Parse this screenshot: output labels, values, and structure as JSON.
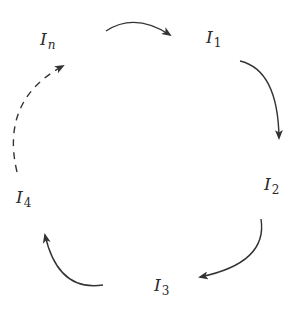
{
  "diagram": {
    "type": "cycle",
    "nodes": [
      {
        "id": "In",
        "base": "I",
        "subscript": "n",
        "subscript_italic": true
      },
      {
        "id": "I1",
        "base": "I",
        "subscript": "1",
        "subscript_italic": false
      },
      {
        "id": "I2",
        "base": "I",
        "subscript": "2",
        "subscript_italic": false
      },
      {
        "id": "I3",
        "base": "I",
        "subscript": "3",
        "subscript_italic": false
      },
      {
        "id": "I4",
        "base": "I",
        "subscript": "4",
        "subscript_italic": false
      }
    ],
    "edges": [
      {
        "from": "In",
        "to": "I1",
        "style": "solid"
      },
      {
        "from": "I1",
        "to": "I2",
        "style": "solid"
      },
      {
        "from": "I2",
        "to": "I3",
        "style": "solid"
      },
      {
        "from": "I3",
        "to": "I4",
        "style": "solid"
      },
      {
        "from": "I4",
        "to": "In",
        "style": "dashed"
      }
    ],
    "colors": {
      "stroke": "#333333",
      "text": "#2a2a2a",
      "background": "#ffffff"
    }
  }
}
